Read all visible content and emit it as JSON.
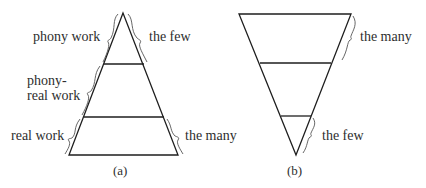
{
  "diagram_a": {
    "caption": "(a)",
    "labels": {
      "top_left": "phony work",
      "top_right": "the few",
      "middle_left_line1": "phony-",
      "middle_left_line2": "real work",
      "bottom_left": "real work",
      "bottom_right": "the many"
    },
    "shape": "upright-pyramid",
    "tiers": 3
  },
  "diagram_b": {
    "caption": "(b)",
    "labels": {
      "top_right": "the many",
      "bottom_right": "the few"
    },
    "shape": "inverted-pyramid",
    "tiers": 3
  },
  "colors": {
    "line": "#1e1e1e",
    "brace": "#555555",
    "text": "#2e2e2e"
  }
}
